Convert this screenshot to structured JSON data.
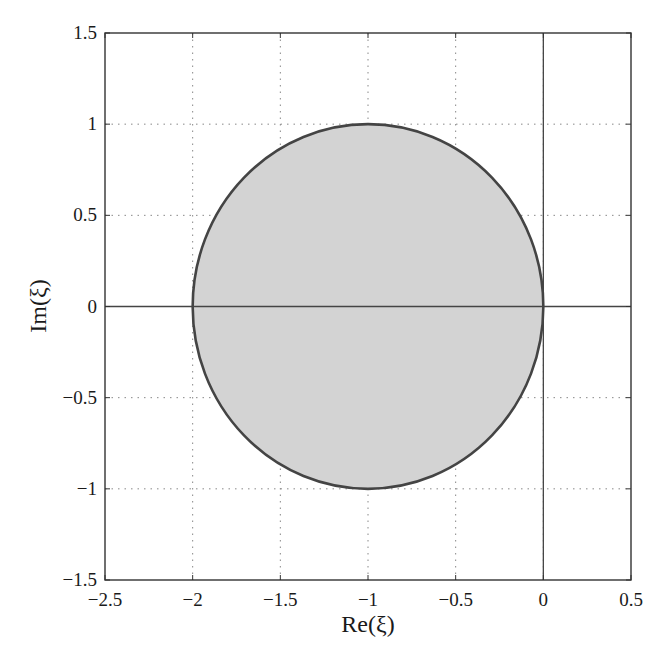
{
  "chart_data": {
    "type": "area",
    "title": "",
    "xlabel": "Re(ξ)",
    "ylabel": "Im(ξ)",
    "xlim": [
      -2.5,
      0.5
    ],
    "ylim": [
      -1.5,
      1.5
    ],
    "xticks": [
      -2.5,
      -2,
      -1.5,
      -1,
      -0.5,
      0,
      0.5
    ],
    "yticks": [
      -1.5,
      -1,
      -0.5,
      0,
      0.5,
      1,
      1.5
    ],
    "xtick_labels": [
      "−2.5",
      "−2",
      "−1.5",
      "−1",
      "−0.5",
      "0",
      "0.5"
    ],
    "ytick_labels": [
      "−1.5",
      "−1",
      "−0.5",
      "0",
      "0.5",
      "1",
      "1.5"
    ],
    "grid": true,
    "grid_style": "dotted",
    "legend": null,
    "reference_lines": [
      {
        "orientation": "horizontal",
        "value": 0
      },
      {
        "orientation": "vertical",
        "value": 0
      }
    ],
    "shapes": [
      {
        "type": "filled-circle",
        "center": [
          -1,
          0
        ],
        "radius": 1,
        "fill": "#d3d3d3",
        "stroke": "#444444",
        "description": "Stability region: disk |ξ + 1| ≤ 1"
      }
    ]
  },
  "colors": {
    "fill": "#d3d3d3",
    "stroke": "#444444",
    "axes": "#333333",
    "grid": "#888888"
  }
}
